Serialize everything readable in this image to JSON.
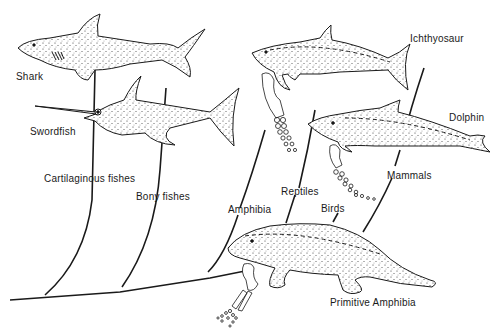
{
  "diagram": {
    "type": "phylogenetic-tree",
    "line_color": "#1a1a1a",
    "fill_color": "#ffffff",
    "labels": {
      "shark": "Shark",
      "swordfish": "Swordfish",
      "ichthyosaur": "Ichthyosaur",
      "dolphin": "Dolphin",
      "cartilaginous": "Cartilaginous fishes",
      "bony": "Bony fishes",
      "amphibia": "Amphibia",
      "reptiles": "Reptiles",
      "birds": "Birds",
      "mammals": "Mammals",
      "primitive_amphibia": "Primitive Amphibia"
    }
  }
}
